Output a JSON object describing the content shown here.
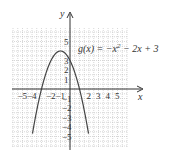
{
  "chart_data": {
    "type": "line",
    "title": "",
    "function_label": "g(x) = −x² − 2x + 3",
    "function": {
      "a": -1,
      "b": -2,
      "c": 3
    },
    "xlabel": "x",
    "ylabel": "y",
    "xlim": [
      -6,
      6
    ],
    "ylim": [
      -6,
      6
    ],
    "grid": true,
    "x_ticks": [
      "-5",
      "-4",
      "-2",
      "-1",
      "2",
      "3",
      "4",
      "5"
    ],
    "y_ticks": [
      "5",
      "3",
      "2",
      "1",
      "-1",
      "-2",
      "-3",
      "-4",
      "-5"
    ],
    "vertex": [
      -1,
      4
    ],
    "roots": [
      -3,
      1
    ],
    "y_intercept": 3,
    "series": [
      {
        "name": "g(x)",
        "x": [
          -3.9,
          -3,
          -2,
          -1,
          0,
          1,
          1.9
        ],
        "y": [
          -4.41,
          0,
          3,
          4,
          3,
          0,
          -4.41
        ]
      }
    ]
  },
  "labels": {
    "x_axis": "x",
    "y_axis": "y",
    "func_g": "g(x) = −x",
    "func_sup": "2",
    "func_rest": " − 2x + 3"
  },
  "colors": {
    "axis": "#333333",
    "curve": "#444444",
    "grid": "#bdbdbd"
  }
}
